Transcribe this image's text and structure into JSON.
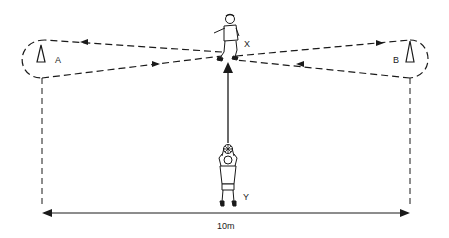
{
  "diagram": {
    "type": "football-drill",
    "labels": {
      "cone_a": "A",
      "cone_b": "B",
      "player_x": "X",
      "player_y": "Y",
      "distance": "10m"
    },
    "colors": {
      "ink": "#1a1a1a",
      "background": "#ffffff"
    },
    "paths": [
      {
        "from": "X",
        "to": "A",
        "style": "dashed",
        "direction": "X->A"
      },
      {
        "from": "A",
        "to": "X",
        "style": "dashed",
        "direction": "A->X"
      },
      {
        "from": "X",
        "to": "B",
        "style": "dashed",
        "direction": "X->B"
      },
      {
        "from": "B",
        "to": "X",
        "style": "dashed",
        "direction": "B->X"
      },
      {
        "from": "Y",
        "to": "X",
        "style": "solid",
        "direction": "Y->X",
        "meaning": "ball thrown"
      }
    ],
    "measurement": {
      "label": "10m",
      "span": "A to B"
    }
  }
}
